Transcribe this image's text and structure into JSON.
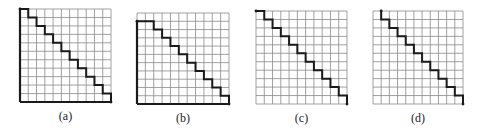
{
  "figure": {
    "grid_size": 11,
    "colors": {
      "grid": "#8a8a8a",
      "path": "#1a1a1a",
      "background": "#ffffff"
    },
    "panels": [
      {
        "id": "a",
        "label": "(a)",
        "box": {
          "x": 20,
          "y": 9,
          "w": 91,
          "h": 93
        },
        "thick_left": [
          0,
          11
        ],
        "thick_bottom": true,
        "path": [
          [
            0,
            0
          ],
          [
            1,
            0
          ],
          [
            1,
            1
          ],
          [
            2,
            1
          ],
          [
            2,
            2
          ],
          [
            3,
            2
          ],
          [
            3,
            3
          ],
          [
            4,
            3
          ],
          [
            4,
            4
          ],
          [
            5,
            4
          ],
          [
            5,
            5
          ],
          [
            6,
            5
          ],
          [
            6,
            6
          ],
          [
            7,
            6
          ],
          [
            7,
            7
          ],
          [
            8,
            7
          ],
          [
            8,
            8
          ],
          [
            9,
            8
          ],
          [
            9,
            9
          ],
          [
            10,
            9
          ],
          [
            10,
            10
          ],
          [
            11,
            10
          ],
          [
            11,
            11
          ]
        ]
      },
      {
        "id": "b",
        "label": "(b)",
        "box": {
          "x": 137,
          "y": 13,
          "w": 92,
          "h": 91
        },
        "thick_left": [
          1,
          11
        ],
        "thick_bottom": true,
        "path": [
          [
            0,
            1
          ],
          [
            2,
            1
          ],
          [
            2,
            2
          ],
          [
            3,
            2
          ],
          [
            3,
            3
          ],
          [
            4,
            3
          ],
          [
            4,
            4
          ],
          [
            5,
            4
          ],
          [
            5,
            5
          ],
          [
            6,
            5
          ],
          [
            6,
            6
          ],
          [
            7,
            6
          ],
          [
            7,
            7
          ],
          [
            8,
            7
          ],
          [
            8,
            8
          ],
          [
            9,
            8
          ],
          [
            9,
            9
          ],
          [
            10,
            9
          ],
          [
            10,
            10
          ],
          [
            11,
            10
          ],
          [
            11,
            11
          ]
        ]
      },
      {
        "id": "c",
        "label": "(c)",
        "box": {
          "x": 256,
          "y": 11,
          "w": 91,
          "h": 93
        },
        "thick_left": null,
        "thick_bottom": false,
        "path": [
          [
            0,
            0
          ],
          [
            1,
            0
          ],
          [
            1,
            1
          ],
          [
            2,
            1
          ],
          [
            2,
            2
          ],
          [
            3,
            2
          ],
          [
            3,
            3
          ],
          [
            4,
            3
          ],
          [
            4,
            4
          ],
          [
            5,
            4
          ],
          [
            5,
            5
          ],
          [
            6,
            5
          ],
          [
            6,
            6
          ],
          [
            7,
            6
          ],
          [
            7,
            7
          ],
          [
            8,
            7
          ],
          [
            8,
            8
          ],
          [
            9,
            8
          ],
          [
            9,
            9
          ],
          [
            10,
            9
          ],
          [
            10,
            10
          ],
          [
            11,
            10
          ],
          [
            11,
            11
          ]
        ]
      },
      {
        "id": "d",
        "label": "(d)",
        "box": {
          "x": 373,
          "y": 11,
          "w": 90,
          "h": 93
        },
        "thick_left": null,
        "thick_bottom": false,
        "path": [
          [
            1,
            0
          ],
          [
            1,
            1
          ],
          [
            2,
            1
          ],
          [
            2,
            2
          ],
          [
            3,
            2
          ],
          [
            3,
            3
          ],
          [
            4,
            3
          ],
          [
            4,
            4
          ],
          [
            5,
            4
          ],
          [
            5,
            5
          ],
          [
            6,
            5
          ],
          [
            6,
            6
          ],
          [
            7,
            6
          ],
          [
            7,
            7
          ],
          [
            8,
            7
          ],
          [
            8,
            8
          ],
          [
            9,
            8
          ],
          [
            9,
            9
          ],
          [
            10,
            9
          ],
          [
            10,
            10
          ],
          [
            11,
            10
          ],
          [
            11,
            11
          ]
        ]
      }
    ]
  }
}
